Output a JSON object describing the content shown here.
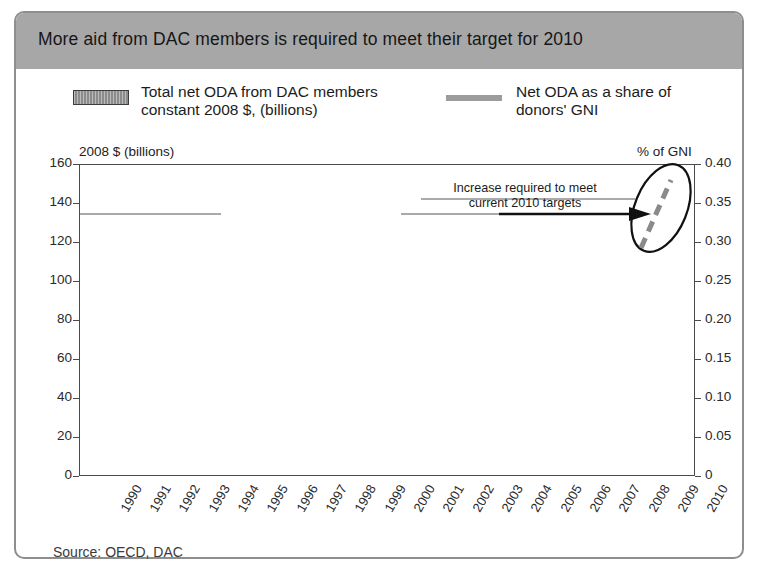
{
  "title": "More aid from DAC members is required to meet their target for 2010",
  "legend": {
    "bars_label": "Total net ODA from DAC members\nconstant 2008 $, (billions)",
    "line_label": "Net ODA as a share of\ndonors' GNI",
    "bar_color": "#8c8c8c",
    "line_color": "#9c9c9c"
  },
  "source": "Source: OECD, DAC",
  "annotation": {
    "text": "Increase required to meet\ncurrent 2010 targets"
  },
  "chart_data": {
    "type": "bar",
    "title": "More aid from DAC members is required to meet their target for 2010",
    "xlabel": "",
    "ylabel": "2008 $ (billions)",
    "y2label": "% of GNI",
    "ylim": [
      0,
      160
    ],
    "y2lim": [
      0,
      0.4
    ],
    "yticks": [
      "0",
      "20",
      "40",
      "60",
      "80",
      "100",
      "120",
      "140",
      "160"
    ],
    "ytick_values": [
      0,
      20,
      40,
      60,
      80,
      100,
      120,
      140,
      160
    ],
    "y2ticks": [
      "0",
      "0.05",
      "0.10",
      "0.15",
      "0.20",
      "0.25",
      "0.30",
      "0.35",
      "0.40"
    ],
    "y2tick_values": [
      0,
      0.05,
      0.1,
      0.15,
      0.2,
      0.25,
      0.3,
      0.35,
      0.4
    ],
    "grid": true,
    "legend_position": "top",
    "categories": [
      "1990",
      "1991",
      "1992",
      "1993",
      "1994",
      "1995",
      "1996",
      "1997",
      "1998",
      "1999",
      "2000",
      "2001",
      "2002",
      "2003",
      "2004",
      "2005",
      "2006",
      "2007",
      "2008",
      "2009",
      "2010"
    ],
    "series": [
      {
        "name": "Total net ODA from DAC members constant 2008 $, (billions)",
        "type": "bar",
        "axis": "left",
        "unit": "billions of constant 2008 $",
        "values": [
          84,
          86,
          88,
          83,
          82,
          75,
          73,
          71,
          76,
          77,
          79,
          82,
          84,
          86,
          95,
          127,
          123,
          111,
          122,
          125,
          157
        ]
      },
      {
        "name": "Net ODA as a share of donors' GNI",
        "type": "line",
        "axis": "right",
        "unit": "% of GNI",
        "values": [
          0.33,
          0.33,
          0.33,
          0.29,
          0.29,
          0.26,
          0.22,
          0.22,
          0.235,
          0.22,
          0.22,
          0.22,
          0.23,
          0.25,
          0.26,
          0.32,
          0.3,
          0.275,
          0.3,
          0.31,
          0.39
        ]
      }
    ],
    "annotations": [
      {
        "text": "Increase required to meet current 2010 targets",
        "type": "arrow-callout",
        "points_to": "2010",
        "highlight": "ellipse around 2009-2010 projected increase",
        "dashed_segment": true
      }
    ]
  }
}
